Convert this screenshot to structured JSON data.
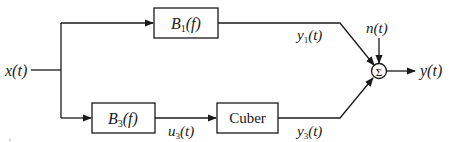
{
  "diagram": {
    "input": {
      "label": "x(t)"
    },
    "blocks": [
      {
        "id": "b1",
        "name": "B",
        "sub": "1",
        "arg": "(f)"
      },
      {
        "id": "b3",
        "name": "B",
        "sub": "3",
        "arg": "(f)"
      },
      {
        "id": "cuber",
        "label": "Cuber"
      }
    ],
    "signals": {
      "y1": {
        "name": "y",
        "sub": "1",
        "arg": "(t)"
      },
      "u3": {
        "name": "u",
        "sub": "3",
        "arg": "(t)"
      },
      "y3": {
        "name": "y",
        "sub": "3",
        "arg": "(t)"
      },
      "noise": "n(t)",
      "output": "y(t)"
    },
    "summer": {
      "symbol": "Σ"
    }
  }
}
